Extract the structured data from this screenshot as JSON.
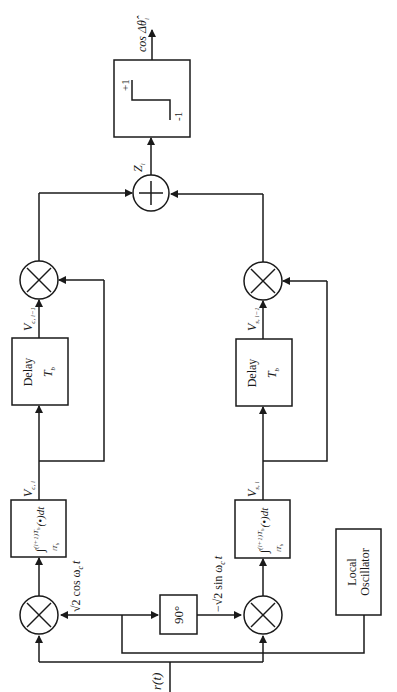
{
  "diagram": {
    "type": "quadrature differential detector block diagram (rotated 90°)",
    "input": {
      "label": "r(t)"
    },
    "local_oscillator": {
      "line1": "Local",
      "line2": "Oscillator"
    },
    "phase_shifter": {
      "label": "90°"
    },
    "carriers": {
      "cos": "√2 cos ω",
      "cos_sub": "c",
      "cos_t": "t",
      "sin": "−√2 sin ω",
      "sin_sub": "c",
      "sin_t": "t"
    },
    "integrators": [
      {
        "upper": "(i+1)T",
        "upper_sub": "b",
        "lower": "iT",
        "lower_sub": "b",
        "body": "(•)dt"
      },
      {
        "upper": "(i+1)T",
        "upper_sub": "b",
        "lower": "iT",
        "lower_sub": "b",
        "body": "(•)dt"
      }
    ],
    "signals": {
      "vci": "V",
      "vci_sub": "c, i",
      "vsi": "V",
      "vsi_sub": "s, i",
      "vci1": "V",
      "vci1_sub": "c, i−1",
      "vsi1": "V",
      "vsi1_sub": "s, i−1",
      "z": "Z",
      "z_sub": "i"
    },
    "delays": [
      {
        "label": "Delay",
        "value": "T",
        "value_sub": "b"
      },
      {
        "label": "Delay",
        "value": "T",
        "value_sub": "b"
      }
    ],
    "multiplier_symbol": "×",
    "summer_symbol": "+",
    "limiter": {
      "high": "+1",
      "low": "-1"
    },
    "output": {
      "label": "cos Δθ̂",
      "label_sub": "i"
    }
  }
}
